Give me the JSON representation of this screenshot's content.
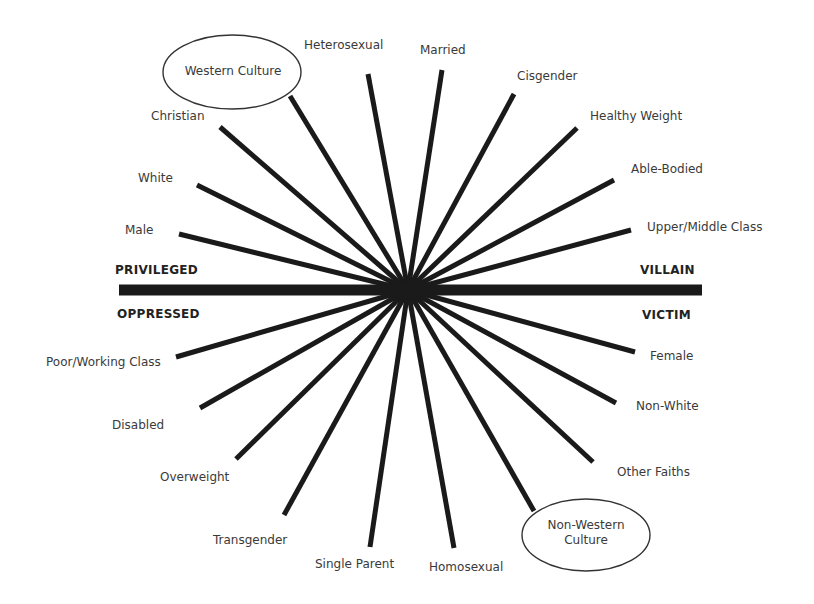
{
  "diagram": {
    "hub": {
      "x": 408,
      "y": 290
    },
    "axis": {
      "x1": 119,
      "x2": 702,
      "y": 290,
      "thickness": 11,
      "color": "#1a1a1a",
      "labels": {
        "top_left": "PRIVILEGED",
        "bottom_left": "OPPRESSED",
        "top_right": "VILLAIN",
        "bottom_right": "VICTIM"
      }
    },
    "spoke_color": "#1a1a1a",
    "spoke_width": 5,
    "privileged_spokes": [
      {
        "label": "Western Culture",
        "end": [
          290,
          96
        ],
        "circled": true
      },
      {
        "label": "Heterosexual",
        "end": [
          368,
          74
        ]
      },
      {
        "label": "Married",
        "end": [
          442,
          70
        ]
      },
      {
        "label": "Cisgender",
        "end": [
          514,
          94
        ]
      },
      {
        "label": "Healthy Weight",
        "end": [
          577,
          128
        ]
      },
      {
        "label": "Able-Bodied",
        "end": [
          614,
          180
        ]
      },
      {
        "label": "Upper/Middle Class",
        "end": [
          631,
          230
        ]
      },
      {
        "label": "Christian",
        "end": [
          220,
          127
        ]
      },
      {
        "label": "White",
        "end": [
          197,
          185
        ]
      },
      {
        "label": "Male",
        "end": [
          179,
          234
        ]
      }
    ],
    "oppressed_spokes": [
      {
        "label": "Poor/Working Class",
        "end": [
          176,
          357
        ]
      },
      {
        "label": "Disabled",
        "end": [
          200,
          408
        ]
      },
      {
        "label": "Overweight",
        "end": [
          236,
          459
        ]
      },
      {
        "label": "Transgender",
        "end": [
          284,
          515
        ]
      },
      {
        "label": "Single Parent",
        "end": [
          370,
          547
        ]
      },
      {
        "label": "Homosexual",
        "end": [
          454,
          548
        ]
      },
      {
        "label": "Non-Western Culture",
        "end": [
          534,
          511
        ],
        "circled": true
      },
      {
        "label": "Other Faiths",
        "end": [
          593,
          462
        ]
      },
      {
        "label": "Non-White",
        "end": [
          616,
          403
        ]
      },
      {
        "label": "Female",
        "end": [
          635,
          352
        ]
      }
    ],
    "ovals": {
      "western": {
        "line1": "Western Culture",
        "cx": 232,
        "cy": 72,
        "rx": 69,
        "ry": 37
      },
      "non_western": {
        "line1": "Non-Western",
        "line2": "Culture",
        "cx": 586,
        "cy": 535,
        "rx": 64,
        "ry": 36
      }
    },
    "labels": {
      "heterosexual": "Heterosexual",
      "married": "Married",
      "cisgender": "Cisgender",
      "healthy_weight": "Healthy Weight",
      "able_bodied": "Able-Bodied",
      "upper_middle_class": "Upper/Middle Class",
      "christian": "Christian",
      "white": "White",
      "male": "Male",
      "poor_working_class": "Poor/Working Class",
      "disabled": "Disabled",
      "overweight": "Overweight",
      "transgender": "Transgender",
      "single_parent": "Single Parent",
      "homosexual": "Homosexual",
      "other_faiths": "Other Faiths",
      "non_white": "Non-White",
      "female": "Female"
    }
  }
}
